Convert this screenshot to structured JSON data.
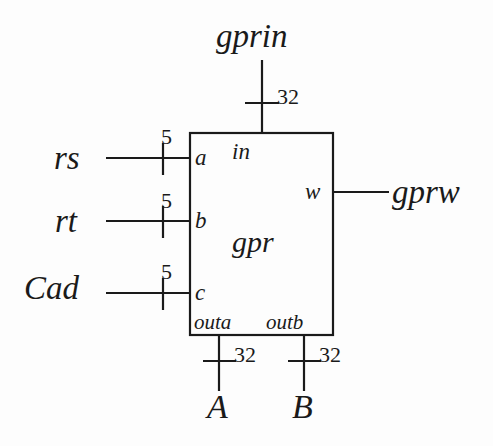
{
  "diagram": {
    "type": "block-diagram",
    "block": {
      "name": "gpr",
      "label_gpr": "gpr"
    },
    "ports": {
      "a": "a",
      "b": "b",
      "c": "c",
      "in": "in",
      "w": "w",
      "outa": "outa",
      "outb": "outb"
    },
    "signals": {
      "gprin": "gprin",
      "rs": "rs",
      "rt": "rt",
      "Cad": "Cad",
      "gprw": "gprw",
      "A": "A",
      "B": "B"
    },
    "bus_widths": {
      "gprin": "32",
      "rs": "5",
      "rt": "5",
      "Cad": "5",
      "outa": "32",
      "outb": "32"
    },
    "colors": {
      "line": "#1a1a1a",
      "text": "#1a1a1a",
      "background": "#fdfdfd"
    }
  }
}
